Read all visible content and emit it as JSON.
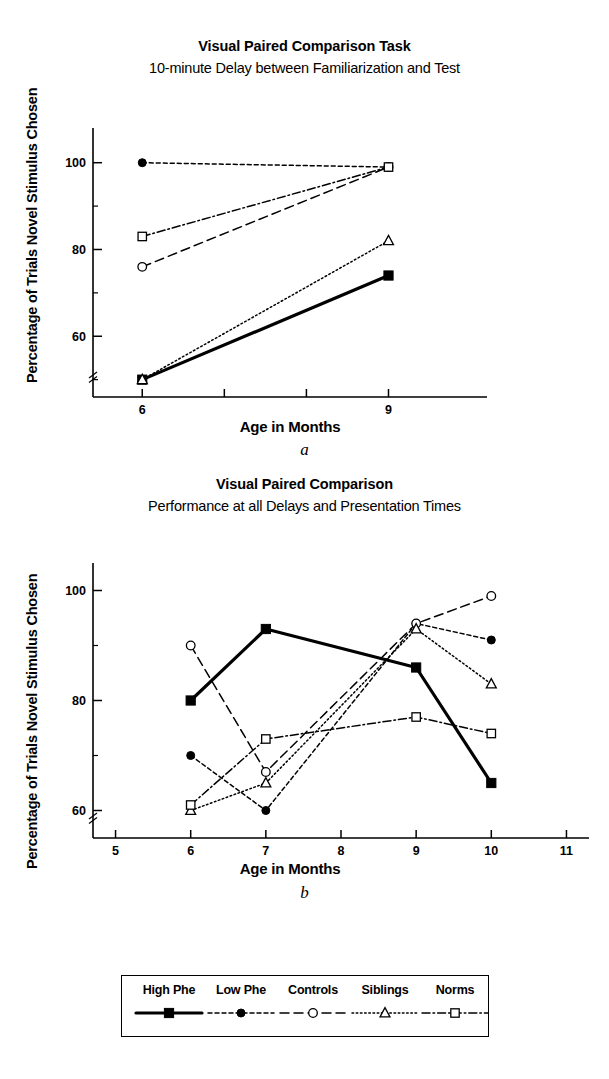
{
  "panel_a": {
    "title": "Visual Paired Comparison Task",
    "subtitle": "10-minute Delay between Familiarization and Test",
    "caption": "a",
    "ylabel": "Percentage of Trials Novel Stimulus Chosen",
    "xlabel": "Age in Months"
  },
  "panel_b": {
    "title": "Visual Paired Comparison",
    "subtitle": "Performance at all Delays and Presentation Times",
    "caption": "b",
    "ylabel": "Percentage of Trials Novel Stimulus Chosen",
    "xlabel": "Age in Months"
  },
  "legend": {
    "items": [
      {
        "label": "High Phe",
        "marker": "filled-square",
        "line": "solid"
      },
      {
        "label": "Low Phe",
        "marker": "filled-circle",
        "line": "dashed-short"
      },
      {
        "label": "Controls",
        "marker": "open-circle",
        "line": "dashed-long"
      },
      {
        "label": "Siblings",
        "marker": "open-triangle",
        "line": "dotted"
      },
      {
        "label": "Norms",
        "marker": "open-square",
        "line": "dash-dot"
      }
    ]
  },
  "chart_data": [
    {
      "type": "line",
      "panel": "a",
      "title": "Visual Paired Comparison Task",
      "subtitle": "10-minute Delay between Familiarization and Test",
      "xlabel": "Age in Months",
      "ylabel": "Percentage of Trials Novel Stimulus Chosen",
      "x": [
        6,
        9
      ],
      "xticks": [
        6,
        9
      ],
      "xlim": [
        5.4,
        10.2
      ],
      "yticks": [
        60,
        80,
        100
      ],
      "yminorticks": [
        50,
        70,
        90,
        110
      ],
      "ylim": [
        46,
        108
      ],
      "axis_break_y": true,
      "grid": false,
      "legend_position": "below-figure",
      "series": [
        {
          "name": "High Phe",
          "values": [
            50,
            74
          ]
        },
        {
          "name": "Low Phe",
          "values": [
            100,
            99
          ]
        },
        {
          "name": "Controls",
          "values": [
            76,
            99
          ]
        },
        {
          "name": "Siblings",
          "values": [
            50,
            82
          ]
        },
        {
          "name": "Norms",
          "values": [
            83,
            99
          ]
        }
      ]
    },
    {
      "type": "line",
      "panel": "b",
      "title": "Visual Paired Comparison",
      "subtitle": "Performance at all Delays and Presentation Times",
      "xlabel": "Age in Months",
      "ylabel": "Percentage of Trials Novel Stimulus Chosen",
      "x": [
        6,
        7,
        9,
        10
      ],
      "xticks": [
        5,
        6,
        7,
        8,
        9,
        10,
        11
      ],
      "xlim": [
        4.7,
        11.3
      ],
      "yticks": [
        60,
        80,
        100
      ],
      "yminorticks": [
        50,
        70,
        90,
        110
      ],
      "ylim": [
        55,
        105
      ],
      "axis_break_y": true,
      "grid": false,
      "legend_position": "below-figure",
      "series": [
        {
          "name": "High Phe",
          "values": [
            80,
            93,
            86,
            65
          ]
        },
        {
          "name": "Low Phe",
          "values": [
            70,
            60,
            94,
            91
          ]
        },
        {
          "name": "Controls",
          "values": [
            90,
            67,
            94,
            99
          ]
        },
        {
          "name": "Siblings",
          "values": [
            60,
            65,
            93,
            83
          ]
        },
        {
          "name": "Norms",
          "values": [
            61,
            73,
            77,
            74
          ]
        }
      ]
    }
  ]
}
